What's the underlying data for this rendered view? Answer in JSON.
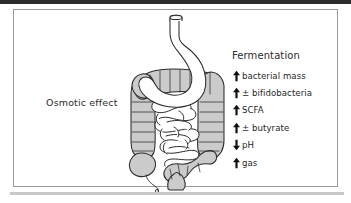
{
  "figure": {
    "background_color": "#ffffff",
    "frame_top_color": "#2b2b2b",
    "frame_line_color": "#9a9a9a",
    "frame_bottom_color": "#c9c9c9"
  },
  "left_caption": {
    "label": "Osmotic effect"
  },
  "illustration": {
    "name": "gastrointestinal-tract-diagram",
    "organs": [
      {
        "name": "esophagus",
        "fill": "#ffffff",
        "stroke": "#2b2b2b"
      },
      {
        "name": "stomach",
        "fill": "#ffffff",
        "stroke": "#2b2b2b"
      },
      {
        "name": "colon",
        "fill": "#cbcbcb",
        "stroke": "#2b2b2b"
      },
      {
        "name": "small-intestine",
        "fill": "#ffffff",
        "stroke": "#2b2b2b"
      },
      {
        "name": "appendix",
        "fill": "#cbcbcb",
        "stroke": "#2b2b2b"
      },
      {
        "name": "rectum",
        "fill": "#cbcbcb",
        "stroke": "#2b2b2b"
      }
    ],
    "colon_fill": "#cbcbcb",
    "outline_color": "#2b2b2b"
  },
  "legend": {
    "heading": "Fermentation",
    "arrow_color": "#111111",
    "items": [
      {
        "arrow": "up",
        "label": "bacterial mass"
      },
      {
        "arrow": "up",
        "label": "± bifidobacteria"
      },
      {
        "arrow": "up",
        "label": "SCFA"
      },
      {
        "arrow": "up",
        "label": "± butyrate"
      },
      {
        "arrow": "down",
        "label": "pH"
      },
      {
        "arrow": "up",
        "label": "gas"
      }
    ]
  }
}
